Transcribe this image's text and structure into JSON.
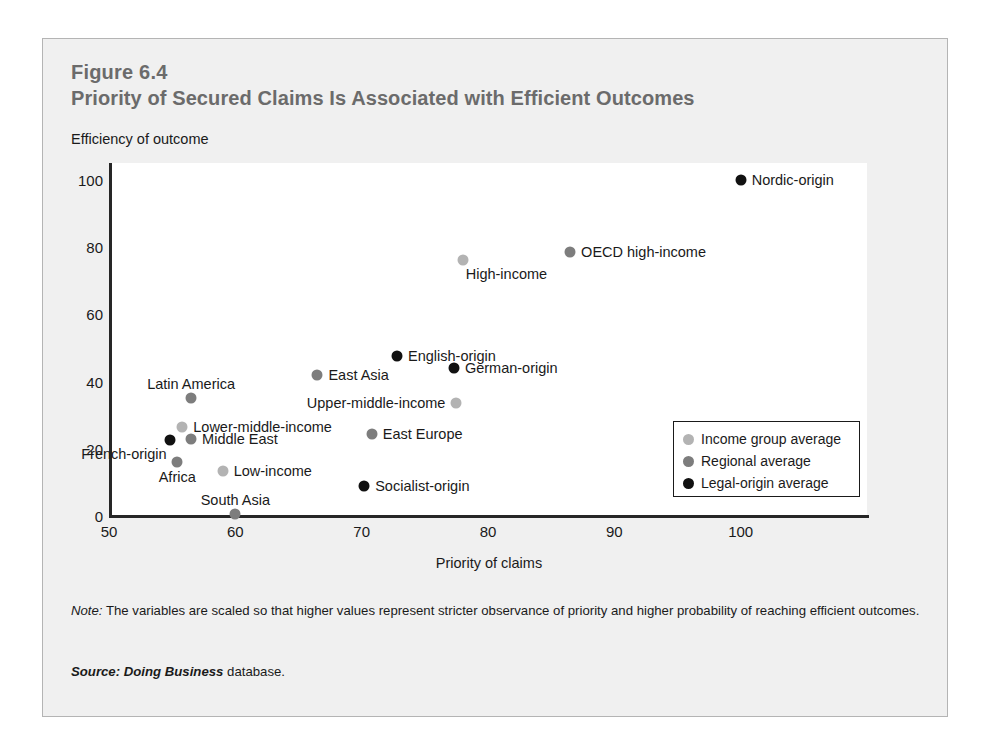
{
  "figure": {
    "number": "Figure 6.4",
    "title": "Priority of Secured Claims Is Associated with Efficient Outcomes",
    "note_lead": "Note:",
    "note_text": " The variables are scaled so that higher values represent stricter observance of priority and higher probability of reaching efficient outcomes.",
    "source_lead": "Source:",
    "source_db": " Doing Business",
    "source_tail": " database."
  },
  "colors": {
    "income_group": "#b3b3b3",
    "regional": "#7d7d7d",
    "legal_origin": "#111111",
    "axis": "#262626",
    "title": "#6b6b6b",
    "panel_bg": "#f0f0f0",
    "plot_bg": "#ffffff"
  },
  "legend": {
    "position": "inside-bottom-right",
    "items": [
      {
        "label": "Income group average",
        "color": "#b3b3b3",
        "series": "income_group"
      },
      {
        "label": "Regional average",
        "color": "#7d7d7d",
        "series": "regional"
      },
      {
        "label": "Legal-origin average",
        "color": "#111111",
        "series": "legal_origin"
      }
    ]
  },
  "chart_data": {
    "type": "scatter",
    "title": "Priority of Secured Claims Is Associated with Efficient Outcomes",
    "xlabel": "Priority of claims",
    "ylabel": "Efficiency of outcome",
    "xlim": [
      50,
      110
    ],
    "ylim": [
      0,
      105
    ],
    "xticks": [
      50,
      60,
      70,
      80,
      90,
      100
    ],
    "yticks": [
      0,
      20,
      40,
      60,
      80,
      100
    ],
    "grid": false,
    "series": [
      {
        "name": "Income group average",
        "color": "#b3b3b3",
        "points": [
          {
            "label": "High-income",
            "x": 78.0,
            "y": 76.0,
            "label_pos": "below-right"
          },
          {
            "label": "Upper-middle-income",
            "x": 77.5,
            "y": 33.5,
            "label_pos": "left"
          },
          {
            "label": "Lower-middle-income",
            "x": 55.8,
            "y": 26.5,
            "label_pos": "right"
          },
          {
            "label": "Low-income",
            "x": 59.0,
            "y": 13.5,
            "label_pos": "right"
          }
        ]
      },
      {
        "name": "Regional average",
        "color": "#7d7d7d",
        "points": [
          {
            "label": "OECD high-income",
            "x": 86.5,
            "y": 78.5,
            "label_pos": "right"
          },
          {
            "label": "East Asia",
            "x": 66.5,
            "y": 42.0,
            "label_pos": "right"
          },
          {
            "label": "Latin America",
            "x": 56.5,
            "y": 35.0,
            "label_pos": "above"
          },
          {
            "label": "East Europe",
            "x": 70.8,
            "y": 24.5,
            "label_pos": "right"
          },
          {
            "label": "Middle East",
            "x": 56.5,
            "y": 23.0,
            "label_pos": "right"
          },
          {
            "label": "Africa",
            "x": 55.4,
            "y": 16.0,
            "label_pos": "below"
          },
          {
            "label": "South Asia",
            "x": 60.0,
            "y": 0.5,
            "label_pos": "above"
          }
        ]
      },
      {
        "name": "Legal-origin average",
        "color": "#111111",
        "points": [
          {
            "label": "Nordic-origin",
            "x": 100.0,
            "y": 100.0,
            "label_pos": "right"
          },
          {
            "label": "English-origin",
            "x": 72.8,
            "y": 47.5,
            "label_pos": "right"
          },
          {
            "label": "German-origin",
            "x": 77.3,
            "y": 44.0,
            "label_pos": "right"
          },
          {
            "label": "French-origin",
            "x": 54.8,
            "y": 22.5,
            "label_pos": "below-left"
          },
          {
            "label": "Socialist-origin",
            "x": 70.2,
            "y": 9.0,
            "label_pos": "right"
          }
        ]
      }
    ]
  }
}
